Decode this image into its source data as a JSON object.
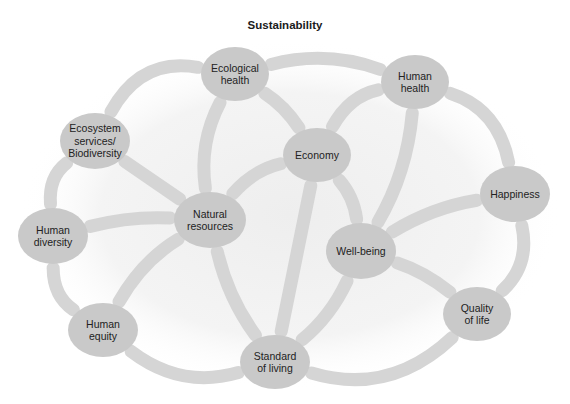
{
  "title": "Sustainability",
  "colors": {
    "node_fill": "#c9c9c9",
    "edge_stroke": "#d5d5d5",
    "text": "#222222",
    "background_glow": "#ececec"
  },
  "nodes": [
    {
      "id": "ecological_health",
      "lines": [
        "Ecological",
        "health"
      ],
      "cx": 235,
      "cy": 74,
      "rx": 34,
      "ry": 27
    },
    {
      "id": "human_health",
      "lines": [
        "Human",
        "health"
      ],
      "cx": 415,
      "cy": 82,
      "rx": 34,
      "ry": 27
    },
    {
      "id": "ecosystem_services",
      "lines": [
        "Ecosystem",
        "services/",
        "Biodiversity"
      ],
      "cx": 95,
      "cy": 141,
      "rx": 35,
      "ry": 28
    },
    {
      "id": "economy",
      "lines": [
        "Economy"
      ],
      "cx": 317,
      "cy": 155,
      "rx": 34,
      "ry": 27
    },
    {
      "id": "happiness",
      "lines": [
        "Happiness"
      ],
      "cx": 515,
      "cy": 194,
      "rx": 35,
      "ry": 28
    },
    {
      "id": "natural_resources",
      "lines": [
        "Natural",
        "resources"
      ],
      "cx": 210,
      "cy": 220,
      "rx": 36,
      "ry": 28
    },
    {
      "id": "human_diversity",
      "lines": [
        "Human",
        "diversity"
      ],
      "cx": 53,
      "cy": 236,
      "rx": 35,
      "ry": 28
    },
    {
      "id": "well_being",
      "lines": [
        "Well-being"
      ],
      "cx": 361,
      "cy": 251,
      "rx": 35,
      "ry": 28
    },
    {
      "id": "quality_of_life",
      "lines": [
        "Quality",
        "of life"
      ],
      "cx": 477,
      "cy": 314,
      "rx": 34,
      "ry": 27
    },
    {
      "id": "human_equity",
      "lines": [
        "Human",
        "equity"
      ],
      "cx": 103,
      "cy": 330,
      "rx": 35,
      "ry": 27
    },
    {
      "id": "standard_of_living",
      "lines": [
        "Standard",
        "of living"
      ],
      "cx": 275,
      "cy": 362,
      "rx": 35,
      "ry": 27
    }
  ],
  "edges": [
    {
      "from": "ecological_health",
      "to": "human_health",
      "bend": -14
    },
    {
      "from": "human_health",
      "to": "happiness",
      "bend": -22
    },
    {
      "from": "happiness",
      "to": "quality_of_life",
      "bend": -18
    },
    {
      "from": "quality_of_life",
      "to": "standard_of_living",
      "bend": -30
    },
    {
      "from": "standard_of_living",
      "to": "human_equity",
      "bend": -22
    },
    {
      "from": "human_equity",
      "to": "human_diversity",
      "bend": -14
    },
    {
      "from": "human_diversity",
      "to": "ecosystem_services",
      "bend": -14
    },
    {
      "from": "ecosystem_services",
      "to": "ecological_health",
      "bend": -28
    },
    {
      "from": "ecological_health",
      "to": "natural_resources",
      "bend": 12
    },
    {
      "from": "ecological_health",
      "to": "economy",
      "bend": -6
    },
    {
      "from": "human_health",
      "to": "economy",
      "bend": 14
    },
    {
      "from": "human_health",
      "to": "well_being",
      "bend": -10
    },
    {
      "from": "economy",
      "to": "natural_resources",
      "bend": 10
    },
    {
      "from": "economy",
      "to": "well_being",
      "bend": -8
    },
    {
      "from": "economy",
      "to": "standard_of_living",
      "bend": 0
    },
    {
      "from": "ecosystem_services",
      "to": "natural_resources",
      "bend": 0
    },
    {
      "from": "human_diversity",
      "to": "natural_resources",
      "bend": -6
    },
    {
      "from": "human_equity",
      "to": "natural_resources",
      "bend": -10
    },
    {
      "from": "natural_resources",
      "to": "standard_of_living",
      "bend": 8
    },
    {
      "from": "well_being",
      "to": "standard_of_living",
      "bend": -8
    },
    {
      "from": "well_being",
      "to": "happiness",
      "bend": -8
    },
    {
      "from": "well_being",
      "to": "quality_of_life",
      "bend": -6
    }
  ]
}
